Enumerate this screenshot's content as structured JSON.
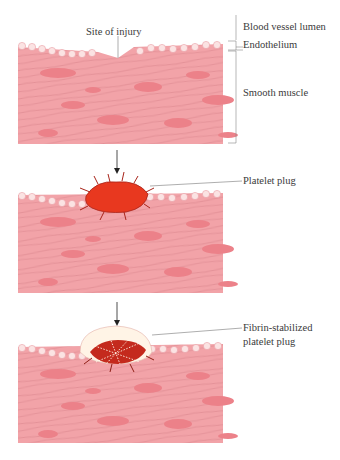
{
  "figure": {
    "stages": [
      {
        "id": "injury",
        "labels": {
          "site": "Site of injury",
          "lumen": "Blood vessel lumen",
          "endothelium": "Endothelium",
          "muscle": "Smooth muscle"
        }
      },
      {
        "id": "platelet-plug",
        "labels": {
          "plug": "Platelet plug"
        }
      },
      {
        "id": "fibrin-plug",
        "labels": {
          "line1": "Fibrin-stabilized",
          "line2": "platelet plug"
        }
      }
    ],
    "colors": {
      "muscle": "#f2a3a8",
      "muscle_nucleus": "#ec8189",
      "fiber": "#c97078",
      "endothelium_cell": "#fbe3e3",
      "endothelium_nucleus": "#d9606b",
      "platelet": "#e8381f",
      "platelet_dark": "#a8241a",
      "fibrin": "#fff4e6",
      "label_text": "#3a3a3a",
      "leader_line": "#777777"
    }
  }
}
